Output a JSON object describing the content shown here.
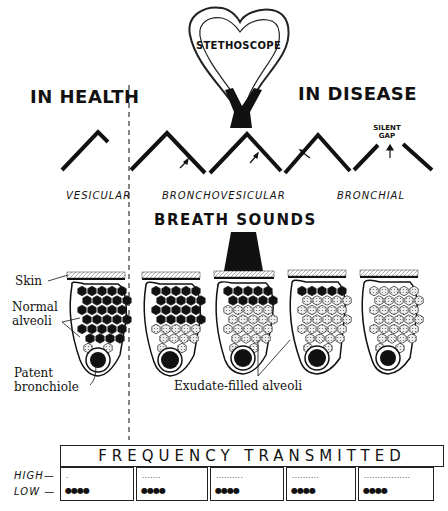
{
  "stethoscope": {
    "label": "STETHOSCOPE"
  },
  "sections": {
    "health": "IN HEALTH",
    "disease": "IN DISEASE"
  },
  "waveforms": {
    "silent_gap": [
      "SILENT",
      "GAP"
    ],
    "labels": [
      "VESICULAR",
      "BRONCHOVESICULAR",
      "BRONCHIAL"
    ]
  },
  "breath_sounds_title": "BREATH SOUNDS",
  "anatomy_labels": {
    "skin": "Skin",
    "normal_alveoli": [
      "Normal",
      "alveoli"
    ],
    "patent_bronchiole": [
      "Patent",
      "bronchiole"
    ],
    "exudate": "Exudate-filled alveoli"
  },
  "lobules": [
    {
      "id": 1,
      "state": "normal",
      "dark_rows": 6
    },
    {
      "id": 2,
      "state": "bronchovesicular-early",
      "dark_rows": 4
    },
    {
      "id": 3,
      "state": "bronchovesicular-late",
      "dark_rows": 2
    },
    {
      "id": 4,
      "state": "bronchial-early",
      "dark_rows": 1
    },
    {
      "id": 5,
      "state": "bronchial",
      "dark_rows": 0
    }
  ],
  "frequency": {
    "title": "FREQUENCY TRANSMITTED",
    "row_labels": {
      "high": "HIGH",
      "low": "LOW"
    },
    "cells": [
      {
        "high": "·",
        "low": "●●●●"
      },
      {
        "high": "·······",
        "low": "●●●●"
      },
      {
        "high": "··········",
        "low": "●●●●"
      },
      {
        "high": "··········",
        "low": "●●●●"
      },
      {
        "high": "·················",
        "low": "●●●●"
      }
    ]
  }
}
